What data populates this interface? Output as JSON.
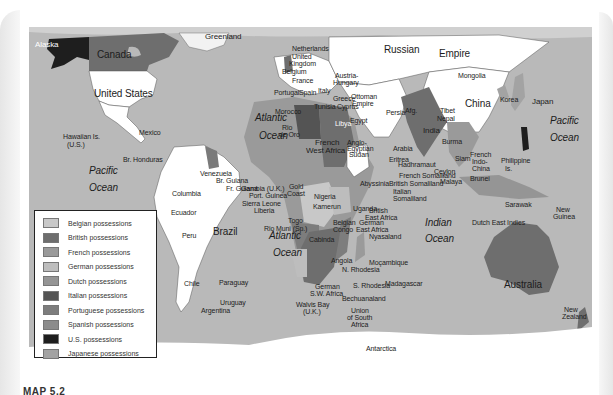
{
  "map": {
    "caption": "MAP 5.2",
    "ocean_color": "#b9b9b9",
    "legend": {
      "items": [
        {
          "label": "Belgian possessions",
          "color": "#c8c8c8"
        },
        {
          "label": "British possessions",
          "color": "#6e6e6e"
        },
        {
          "label": "French possessions",
          "color": "#9a9a9a"
        },
        {
          "label": "German possessions",
          "color": "#bdbdbd"
        },
        {
          "label": "Dutch possessions",
          "color": "#959595"
        },
        {
          "label": "Italian possessions",
          "color": "#545454"
        },
        {
          "label": "Portuguese possessions",
          "color": "#7d7d7d"
        },
        {
          "label": "Spanish possessions",
          "color": "#8c8c8c"
        },
        {
          "label": "U.S. possessions",
          "color": "#1e1e1e"
        },
        {
          "label": "Japanese possessions",
          "color": "#a3a3a3"
        }
      ]
    },
    "labels": {
      "alaska": "Alaska",
      "canada": "Canada",
      "greenland": "Greenland",
      "united_states": "United States",
      "mexico": "Mexico",
      "hawaii": "Hawaiian Is.",
      "hawaii_us": "(U.S.)",
      "br_honduras": "Br. Honduras",
      "pacific_w": "Pacific",
      "ocean_pw": "Ocean",
      "atlantic_n": "Atlantic",
      "ocean_an": "Ocean",
      "atlantic_s": "Atlantic",
      "ocean_as": "Ocean",
      "indian": "Indian",
      "ocean_i": "Ocean",
      "pacific_e": "Pacific",
      "ocean_pe": "Ocean",
      "netherlands": "Netherlands",
      "united_kingdom_1": "United",
      "united_kingdom_2": "Kingdom",
      "belgium": "Belgium",
      "germany": "German Empire",
      "france": "France",
      "austria": "Austria-",
      "hungary": "Hungary",
      "portugal": "Portugal",
      "spain": "Spain",
      "italy": "Italy",
      "greece": "Greece",
      "ottoman_1": "Ottoman",
      "ottoman_2": "Empire",
      "morocco": "Morocco",
      "tunisia": "Tunisia",
      "cyprus": "Cyprus",
      "rio_de_oro_1": "Rio",
      "rio_de_oro_2": "de Oro",
      "libya": "Libya",
      "egypt": "Egypt",
      "persia": "Persia",
      "afg": "Afg.",
      "arabia": "Arabia",
      "russian": "Russian",
      "empire": "Empire",
      "mongolia": "Mongolia",
      "china": "China",
      "korea": "Korea",
      "japan": "Japan",
      "tibet": "Tibet",
      "nepal": "Nepal",
      "india": "India",
      "burma": "Burma",
      "siam": "Siam",
      "fr_indochina_1": "French",
      "fr_indochina_2": "Indo-",
      "fr_indochina_3": "China",
      "philippine_1": "Philippine",
      "philippine_2": "Is.",
      "ceylon": "Ceylon",
      "malaya": "Malaya",
      "brunei": "Brunei",
      "sarawak": "Sarawak",
      "dutch_east_indies": "Dutch East Indies",
      "new_guinea_1": "New",
      "new_guinea_2": "Guinea",
      "australia": "Australia",
      "new_zealand_1": "New",
      "new_zealand_2": "Zealand",
      "french_west_africa_1": "French",
      "french_west_africa_2": "West Africa",
      "anglo_egyptian_1": "Anglo-",
      "anglo_egyptian_2": "Egyptian",
      "anglo_egyptian_3": "Sudan",
      "eritrea": "Eritrea",
      "hadhramaut": "Hadhramaut",
      "fr_somaliland": "French Somaliland",
      "br_somaliland": "British Somaliland",
      "abyssinia": "Abyssinia",
      "it_somaliland_1": "Italian",
      "it_somaliland_2": "Somaliland",
      "gambia": "Gambia (U.K.)",
      "port_guinea": "Port. Guinea",
      "sierra_leone": "Sierra Leone",
      "liberia": "Liberia",
      "gold_coast_1": "Gold",
      "gold_coast_2": "Coast",
      "nigeria": "Nigeria",
      "togo": "Togo",
      "kamerun": "Kamerun",
      "rio_muni": "Rio Muni (Sp.)",
      "fr_eq_africa": "French",
      "uganda": "Uganda",
      "br_east_africa_1": "British",
      "br_east_africa_2": "East Africa",
      "belgian_congo_1": "Belgian",
      "belgian_congo_2": "Congo",
      "german_east_africa_1": "German",
      "german_east_africa_2": "East Africa",
      "cabinda": "Cabinda",
      "angola": "Angola",
      "nyasaland": "Nyasaland",
      "n_rhodesia": "N. Rhodesia",
      "mocambique": "Moçambique",
      "german_sw_africa_1": "German",
      "german_sw_africa_2": "S.W. Africa",
      "s_rhodesia": "S. Rhodesia",
      "madagascar": "Madagascar",
      "walvis_bay_1": "Walvis Bay",
      "walvis_bay_2": "(U.K.)",
      "bechuanaland": "Bechuanaland",
      "union_sa_1": "Union",
      "union_sa_2": "of South",
      "union_sa_3": "Africa",
      "venezuela": "Venezuela",
      "br_guiana": "Br. Guiana",
      "fr_guiana": "Fr. Guiana",
      "columbia": "Columbia",
      "ecuador": "Ecuador",
      "peru": "Peru",
      "brazil": "Brazil",
      "chile": "Chile",
      "paraguay": "Paraguay",
      "uruguay": "Uruguay",
      "argentina": "Argentina",
      "antarctica": "Antarctica"
    }
  }
}
